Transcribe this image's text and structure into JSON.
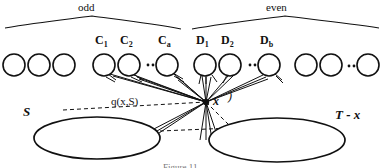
{
  "figure": {
    "groups": [
      {
        "id": "odd",
        "label": "odd",
        "brace_x1": 4,
        "brace_x2": 181,
        "peak_x": 92,
        "label_x": 78,
        "label_y": 2
      },
      {
        "id": "even",
        "label": "even",
        "brace_x1": 192,
        "brace_x2": 379,
        "peak_x": 285,
        "label_x": 266,
        "label_y": 2
      }
    ],
    "nodes": [
      {
        "id": "n1",
        "label": "",
        "sub": "",
        "cx": 14,
        "cy": 65,
        "r": 11,
        "labeled": false
      },
      {
        "id": "n2",
        "label": "",
        "sub": "",
        "cx": 39,
        "cy": 65,
        "r": 11,
        "labeled": false
      },
      {
        "id": "n3",
        "label": "",
        "sub": "",
        "cx": 64,
        "cy": 65,
        "r": 11,
        "labeled": false
      },
      {
        "id": "c1",
        "label": "C",
        "sub": "1",
        "cx": 104,
        "cy": 65,
        "r": 11,
        "labeled": true,
        "label_x": 95,
        "label_y": 36
      },
      {
        "id": "c2",
        "label": "C",
        "sub": "2",
        "cx": 129,
        "cy": 65,
        "r": 11,
        "labeled": true,
        "label_x": 120,
        "label_y": 36
      },
      {
        "id": "ca",
        "label": "C",
        "sub": "a",
        "cx": 167,
        "cy": 65,
        "r": 11,
        "labeled": true,
        "label_x": 158,
        "label_y": 36
      },
      {
        "id": "d1",
        "label": "D",
        "sub": "1",
        "cx": 205,
        "cy": 65,
        "r": 11,
        "labeled": true,
        "label_x": 196,
        "label_y": 36
      },
      {
        "id": "d2",
        "label": "D",
        "sub": "2",
        "cx": 230,
        "cy": 65,
        "r": 11,
        "labeled": true,
        "label_x": 221,
        "label_y": 36
      },
      {
        "id": "db",
        "label": "D",
        "sub": "b",
        "cx": 269,
        "cy": 65,
        "r": 11,
        "labeled": true,
        "label_x": 260,
        "label_y": 36
      },
      {
        "id": "n10",
        "label": "",
        "sub": "",
        "cx": 306,
        "cy": 65,
        "r": 11,
        "labeled": false
      },
      {
        "id": "n11",
        "label": "",
        "sub": "",
        "cx": 331,
        "cy": 65,
        "r": 11,
        "labeled": false
      },
      {
        "id": "n12",
        "label": "",
        "sub": "",
        "cx": 368,
        "cy": 65,
        "r": 11,
        "labeled": false
      }
    ],
    "ellipsis_marks": [
      {
        "id": "e-odd-inner",
        "x": 148,
        "y": 65
      },
      {
        "id": "e-even-inner",
        "x": 250,
        "y": 65
      },
      {
        "id": "e-even-outer",
        "x": 349,
        "y": 66
      }
    ],
    "focal_point": {
      "id": "x",
      "label": "x",
      "cx": 206,
      "cy": 102,
      "label_x": 213,
      "label_y": 95
    },
    "focal_paren": {
      "glyph": ")",
      "x": 228,
      "y": 91
    },
    "sets": [
      {
        "id": "S",
        "label": "S",
        "cx": 97,
        "cy": 138,
        "rx": 63,
        "ry": 21,
        "label_x": 23,
        "label_y": 108
      },
      {
        "id": "T-x",
        "label": "T - x",
        "cx": 277,
        "cy": 140,
        "rx": 68,
        "ry": 22,
        "label_x": 337,
        "label_y": 110
      }
    ],
    "annotation": {
      "id": "q",
      "label": "q(x,S)",
      "x": 111,
      "y": 101
    },
    "caption": "Figure 11",
    "colors": {
      "ink": "#111111",
      "background": "#ffffff"
    }
  }
}
